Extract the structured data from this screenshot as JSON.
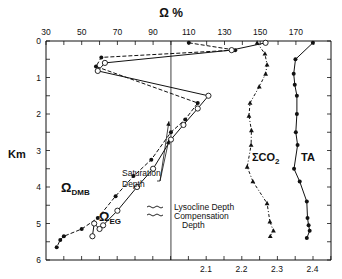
{
  "chart_data": {
    "type": "line",
    "title": "",
    "top_axis": {
      "label": "Ω %",
      "ticks": [
        30,
        50,
        70,
        90,
        110,
        130,
        150,
        170
      ],
      "range": [
        30,
        187
      ]
    },
    "bottom_axis": {
      "label": "",
      "ticks": [
        2.1,
        2.2,
        2.3,
        2.4
      ],
      "range": [
        1.76,
        2.45
      ]
    },
    "y_axis": {
      "label": "Km",
      "ticks": [
        0,
        1,
        2,
        3,
        4,
        5,
        6
      ],
      "range": [
        0,
        6
      ],
      "inverted": true
    },
    "reference_line": {
      "axis": "top",
      "value": 100
    },
    "series": [
      {
        "name": "Ω_DMB",
        "label_main": "Ω",
        "label_sub": "DMB",
        "axis": "top",
        "marker": "filled-circle",
        "line": "dashed",
        "points": [
          {
            "x": 110,
            "depth": 0.05
          },
          {
            "x": 136,
            "depth": 0.25
          },
          {
            "x": 61,
            "depth": 0.45
          },
          {
            "x": 58,
            "depth": 0.7
          },
          {
            "x": 115,
            "depth": 1.7
          },
          {
            "x": 108,
            "depth": 2.15
          },
          {
            "x": 100,
            "depth": 2.5
          },
          {
            "x": 89,
            "depth": 3.25
          },
          {
            "x": 79,
            "depth": 3.7
          },
          {
            "x": 69,
            "depth": 4.25
          },
          {
            "x": 59,
            "depth": 4.85
          },
          {
            "x": 50,
            "depth": 5.15
          },
          {
            "x": 40,
            "depth": 5.35
          },
          {
            "x": 38,
            "depth": 5.45
          },
          {
            "x": 36,
            "depth": 5.65
          }
        ]
      },
      {
        "name": "Ω_EG",
        "label_main": "Ω",
        "label_sub": "EG",
        "axis": "top",
        "marker": "open-circle",
        "line": "solid",
        "points": [
          {
            "x": 153,
            "depth": 0.05
          },
          {
            "x": 134,
            "depth": 0.25
          },
          {
            "x": 63,
            "depth": 0.6
          },
          {
            "x": 59,
            "depth": 0.82
          },
          {
            "x": 121,
            "depth": 1.5
          },
          {
            "x": 115,
            "depth": 1.85
          },
          {
            "x": 107,
            "depth": 2.3
          },
          {
            "x": 100,
            "depth": 2.7
          },
          {
            "x": 90,
            "depth": 3.5
          },
          {
            "x": 81,
            "depth": 4.0
          },
          {
            "x": 70,
            "depth": 4.65
          },
          {
            "x": 62,
            "depth": 5.05
          },
          {
            "x": 60,
            "depth": 5.15
          },
          {
            "x": 57,
            "depth": 5.0
          },
          {
            "x": 56,
            "depth": 5.35
          }
        ]
      },
      {
        "name": "ΣCO2",
        "label_main": "ΣCO",
        "label_sub": "2",
        "axis": "bottom",
        "marker": "filled-triangle",
        "line": "dash-dot",
        "points": [
          {
            "x": 2.244,
            "depth": 0.05
          },
          {
            "x": 2.266,
            "depth": 0.35
          },
          {
            "x": 2.272,
            "depth": 0.65
          },
          {
            "x": 2.268,
            "depth": 0.9
          },
          {
            "x": 2.25,
            "depth": 1.25
          },
          {
            "x": 2.224,
            "depth": 1.7
          },
          {
            "x": 2.221,
            "depth": 2.05
          },
          {
            "x": 2.228,
            "depth": 2.45
          },
          {
            "x": 2.227,
            "depth": 2.85
          },
          {
            "x": 2.216,
            "depth": 3.45
          },
          {
            "x": 2.232,
            "depth": 3.85
          },
          {
            "x": 2.272,
            "depth": 4.45
          },
          {
            "x": 2.28,
            "depth": 4.95
          },
          {
            "x": 2.29,
            "depth": 5.2
          },
          {
            "x": 2.281,
            "depth": 5.35
          }
        ]
      },
      {
        "name": "TA",
        "label_main": "TA",
        "label_sub": "",
        "axis": "bottom",
        "marker": "filled-circle",
        "line": "solid",
        "points": [
          {
            "x": 2.401,
            "depth": 0.05
          },
          {
            "x": 2.352,
            "depth": 0.5
          },
          {
            "x": 2.347,
            "depth": 0.9
          },
          {
            "x": 2.35,
            "depth": 1.2
          },
          {
            "x": 2.356,
            "depth": 1.5
          },
          {
            "x": 2.356,
            "depth": 2.0
          },
          {
            "x": 2.353,
            "depth": 2.5
          },
          {
            "x": 2.358,
            "depth": 2.85
          },
          {
            "x": 2.348,
            "depth": 3.5
          },
          {
            "x": 2.364,
            "depth": 3.85
          },
          {
            "x": 2.384,
            "depth": 4.4
          },
          {
            "x": 2.386,
            "depth": 4.85
          },
          {
            "x": 2.389,
            "depth": 5.05
          },
          {
            "x": 2.392,
            "depth": 5.2
          },
          {
            "x": 2.384,
            "depth": 5.4
          }
        ]
      }
    ],
    "annotations": [
      {
        "text_lines": [
          "Saturation",
          "Depth"
        ],
        "arrows_to_depth": [
          2.2,
          2.7
        ]
      },
      {
        "text": "Lysocline Depth",
        "symbol": "wavy-line"
      },
      {
        "text_lines": [
          "Compensation",
          "Depth"
        ],
        "symbol": "wavy-line"
      }
    ],
    "grid": false,
    "legend": "inline labels"
  },
  "labels": {
    "omega_axis": "Ω %",
    "km": "Km",
    "saturation_1": "Saturation",
    "saturation_2": "Depth",
    "lysocline": "Lysocline Depth",
    "compensation_1": "Compensation",
    "compensation_2": "Depth",
    "dmb_main": "Ω",
    "dmb_sub": "DMB",
    "eg_main": "Ω",
    "eg_sub": "EG",
    "co2_main": "ΣCO",
    "co2_sub": "2",
    "ta": "TA"
  }
}
